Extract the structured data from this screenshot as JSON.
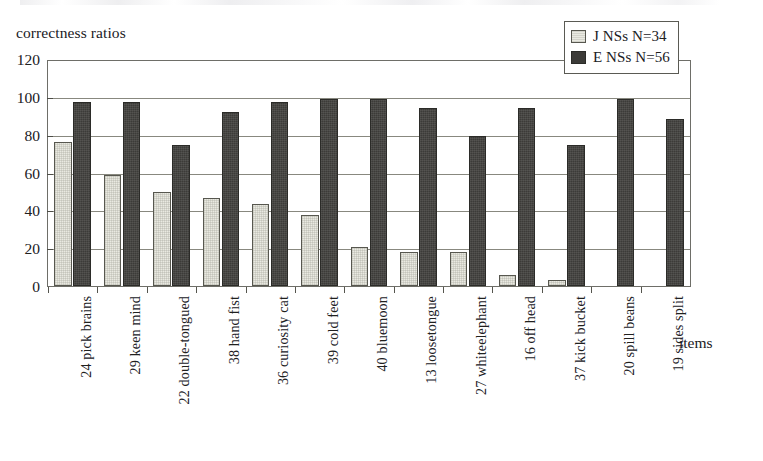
{
  "chart_data": {
    "type": "bar",
    "title": "",
    "ylabel": "correctness ratios",
    "xlabel": "items",
    "ylim": [
      0,
      120
    ],
    "yticks": [
      0,
      20,
      40,
      60,
      80,
      100,
      120
    ],
    "grid": true,
    "grid_axis": "y",
    "legend_position": "top-right",
    "categories": [
      "24 pick brains",
      "29 keen mind",
      "22 double-tongued",
      "38 hand fist",
      "36 curiosity cat",
      "39 cold feet",
      "40 bluemoon",
      "13 loosetongue",
      "27 whiteelephant",
      "16 off head",
      "37 kick bucket",
      "20 spill beans",
      "19 sides split"
    ],
    "series": [
      {
        "name": "J NSs N=34",
        "color": "#e9e9e1",
        "values": [
          77,
          59,
          50,
          47,
          44,
          38,
          21,
          18,
          18,
          6,
          3,
          0,
          0
        ]
      },
      {
        "name": "E NSs N=56",
        "color": "#3c3b38",
        "values": [
          98,
          98,
          75,
          93,
          98,
          100,
          100,
          95,
          80,
          95,
          75,
          100,
          89
        ]
      }
    ]
  },
  "legend": {
    "items": [
      {
        "label": "J NSs N=34",
        "swatch": "light-cream-swatch"
      },
      {
        "label": "E NSs N=56",
        "swatch": "dark-charcoal-swatch"
      }
    ]
  },
  "axes": {
    "y_title": "correctness ratios",
    "x_title": "items",
    "y_tick_labels": [
      "120",
      "100",
      "80",
      "60",
      "40",
      "20",
      "0"
    ]
  }
}
